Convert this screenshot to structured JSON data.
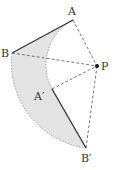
{
  "diagram": {
    "points": {
      "A": {
        "label": "A",
        "x": 73,
        "y": 20
      },
      "B": {
        "label": "B",
        "x": 12,
        "y": 53
      },
      "P": {
        "label": "P",
        "x": 97,
        "y": 66
      },
      "A2": {
        "label": "A′",
        "x": 52,
        "y": 89
      },
      "B2": {
        "label": "B′",
        "x": 86,
        "y": 148
      }
    },
    "colors": {
      "shade": "#e3e3e3",
      "solid": "#333333",
      "dashed": "#555555",
      "arc": "#9a9a9a"
    }
  }
}
